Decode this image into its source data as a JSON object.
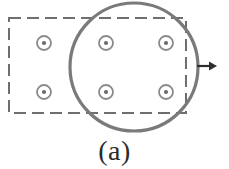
{
  "figure": {
    "caption": "(a)",
    "label_name": "figure-label-a",
    "background_color": "#ffffff"
  },
  "canvas": {
    "width": 229,
    "height": 169
  },
  "dashed_rectangle": {
    "name": "dashed-boundary-rectangle",
    "x": 9,
    "y": 18,
    "width": 177,
    "height": 95,
    "stroke_color": "#6e6e6e",
    "stroke_width": 2,
    "dash_pattern": "12 6"
  },
  "large_circle": {
    "name": "large-circle",
    "cx": 134,
    "cy": 67,
    "r": 64,
    "stroke_color": "#7a7a7a",
    "stroke_width": 3.2,
    "fill": "none"
  },
  "markers": {
    "name_prefix": "circled-dot-marker",
    "outer_radius": 7,
    "inner_radius": 2.1,
    "outer_stroke_color": "#8a8a8a",
    "outer_stroke_width": 1.8,
    "inner_fill_color": "#6b6b6b",
    "items": [
      {
        "id": "marker-top-left",
        "cx": 44,
        "cy": 43
      },
      {
        "id": "marker-top-center",
        "cx": 106,
        "cy": 43
      },
      {
        "id": "marker-top-right",
        "cx": 166,
        "cy": 43
      },
      {
        "id": "marker-bottom-left",
        "cx": 44,
        "cy": 92
      },
      {
        "id": "marker-bottom-center",
        "cx": 106,
        "cy": 92
      },
      {
        "id": "marker-bottom-right",
        "cx": 166,
        "cy": 92
      }
    ]
  },
  "arrow": {
    "name": "direction-arrow-right",
    "x1": 197,
    "y1": 66,
    "x2": 210,
    "y2": 66,
    "tip_x": 217,
    "head_half_height": 4.5,
    "stroke_color": "#2e2e2e",
    "stroke_width": 2.2,
    "fill_color": "#2e2e2e"
  }
}
